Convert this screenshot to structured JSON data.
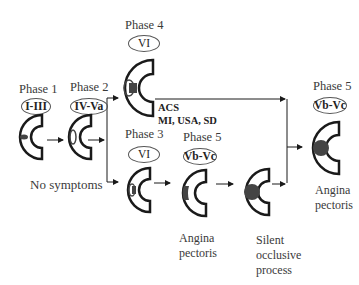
{
  "diagram": {
    "nodes": [
      {
        "id": "p1",
        "phase": "Phase 1",
        "stage": "I-III"
      },
      {
        "id": "p2",
        "phase": "Phase 2",
        "stage": "IV-Va"
      },
      {
        "id": "p4",
        "phase": "Phase 4",
        "stage": "VI"
      },
      {
        "id": "p3",
        "phase": "Phase 3",
        "stage": "VI"
      },
      {
        "id": "p5a",
        "phase": "Phase 5",
        "stage": "Vb-Vc"
      },
      {
        "id": "p5b",
        "phase": "Phase 5",
        "stage": "Vb-Vc"
      }
    ],
    "labels": {
      "no_symptoms": "No symptoms",
      "acs_line1": "ACS",
      "acs_line2": "MI, USA, SD",
      "angina1_line1": "Angina",
      "angina1_line2": "pectoris",
      "silent_line1": "Silent",
      "silent_line2": "occlusive",
      "silent_line3": "process",
      "angina2_line1": "Angina",
      "angina2_line2": "pectoris"
    },
    "colors": {
      "stroke": "#1a1a1a",
      "plaque": "#444444",
      "text": "#3a3a3a"
    }
  }
}
